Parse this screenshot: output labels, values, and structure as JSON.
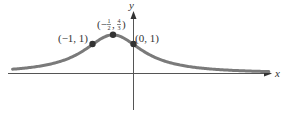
{
  "chart_data": {
    "type": "line",
    "title": "",
    "function": "y = 1/(x^2 + x + 1)",
    "xlabel": "x",
    "ylabel": "y",
    "grid": false,
    "legend": null,
    "xlim": [
      -3.0,
      3.4
    ],
    "ylim": [
      -1.3,
      2.2
    ],
    "series": [
      {
        "name": "curve",
        "x": [
          -2.95,
          -2.5,
          -2,
          -1.5,
          -1,
          -0.75,
          -0.5,
          -0.25,
          0,
          0.5,
          1,
          1.5,
          2,
          2.5,
          3,
          3.3
        ],
        "values": [
          0.15,
          0.21,
          0.33,
          0.57,
          1.0,
          1.23,
          1.333,
          1.23,
          1.0,
          0.57,
          0.33,
          0.21,
          0.14,
          0.11,
          0.08,
          0.07
        ]
      }
    ],
    "annotations": [
      {
        "point": [
          -1,
          1
        ],
        "label": "(−1, 1)"
      },
      {
        "point": [
          -0.5,
          1.3333
        ],
        "label_prefix": "(−",
        "label_num1": "1",
        "label_den1": "2",
        "label_sep": ",",
        "label_num2": "4",
        "label_den2": "3",
        "label_suffix": ")"
      },
      {
        "point": [
          0,
          1
        ],
        "label": "(0, 1)"
      }
    ]
  },
  "colors": {
    "curve": "#7a7a7a",
    "axes": "#555555",
    "points": "#333333",
    "text": "#333333"
  }
}
